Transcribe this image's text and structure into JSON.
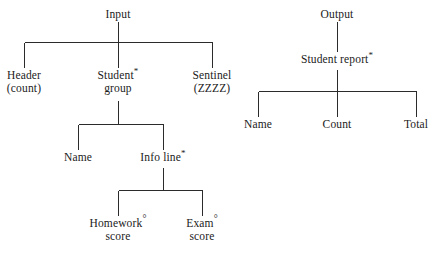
{
  "diagram": {
    "type": "structure-chart",
    "title_visible": false,
    "background_color": "#ffffff",
    "line_color": "#2b2b2b",
    "text_color": "#1b1b1b",
    "trees": [
      {
        "name": "input-tree",
        "root": "Input",
        "nodes": [
          {
            "id": "input",
            "lines": [
              "Input"
            ],
            "marker": ""
          },
          {
            "id": "header",
            "lines": [
              "Header",
              "(count)"
            ],
            "marker": ""
          },
          {
            "id": "student-group",
            "lines": [
              "Student",
              "group"
            ],
            "marker": "*"
          },
          {
            "id": "sentinel",
            "lines": [
              "Sentinel",
              "(ZZZZ)"
            ],
            "marker": ""
          },
          {
            "id": "name",
            "lines": [
              "Name"
            ],
            "marker": ""
          },
          {
            "id": "info-line",
            "lines": [
              "Info line"
            ],
            "marker": "*"
          },
          {
            "id": "homework-score",
            "lines": [
              "Homework",
              "score"
            ],
            "marker": "°"
          },
          {
            "id": "exam-score",
            "lines": [
              "Exam",
              "score"
            ],
            "marker": "°"
          }
        ]
      },
      {
        "name": "output-tree",
        "root": "Output",
        "nodes": [
          {
            "id": "output",
            "lines": [
              "Output"
            ],
            "marker": ""
          },
          {
            "id": "student-report",
            "lines": [
              "Student report"
            ],
            "marker": "*"
          },
          {
            "id": "out-name",
            "lines": [
              "Name"
            ],
            "marker": ""
          },
          {
            "id": "out-count",
            "lines": [
              "Count"
            ],
            "marker": ""
          },
          {
            "id": "out-total",
            "lines": [
              "Total"
            ],
            "marker": ""
          }
        ]
      }
    ],
    "labels": {
      "input": "Input",
      "header_l1": "Header",
      "header_l2": "(count)",
      "student_l1": "Student",
      "student_marker": "*",
      "student_l2": "group",
      "sentinel_l1": "Sentinel",
      "sentinel_l2": "(ZZZZ)",
      "name": "Name",
      "info_line": "Info line",
      "info_line_marker": "*",
      "homework_l1": "Homework",
      "homework_marker": "°",
      "homework_l2": "score",
      "exam_l1": "Exam",
      "exam_marker": "°",
      "exam_l2": "score",
      "output": "Output",
      "student_report": "Student report",
      "student_report_marker": "*",
      "out_name": "Name",
      "out_count": "Count",
      "out_total": "Total"
    }
  }
}
